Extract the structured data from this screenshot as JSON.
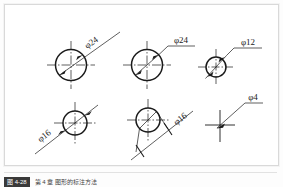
{
  "figure": {
    "frame_color": "#d9d9d9",
    "line_color": "#1a1a1a",
    "background": "#ffffff"
  },
  "caption": {
    "tag": "图 4-28",
    "text": "第 4 章 图形的标注方法"
  },
  "items": [
    {
      "id": "circle-phi24-oblique",
      "label": "φ24",
      "value": 24,
      "diameter_px": 31,
      "center": {
        "x": 66,
        "y": 60
      },
      "leader_style": "oblique-through-circle",
      "text_rotated": true,
      "text_angle": -35,
      "arrows": "both-ends-inside",
      "centerlines": "dash-dot-cross"
    },
    {
      "id": "circle-phi24-horizontal-shelf",
      "label": "φ24",
      "value": 24,
      "diameter_px": 31,
      "center": {
        "x": 142,
        "y": 60
      },
      "leader_style": "diagonal-with-horizontal-shelf",
      "text_rotated": false,
      "text_angle": 0,
      "arrows": "both-ends-inside",
      "centerlines": "dash-dot-cross"
    },
    {
      "id": "circle-phi12",
      "label": "φ12",
      "value": 12,
      "diameter_px": 20,
      "center": {
        "x": 211,
        "y": 62
      },
      "leader_style": "diagonal-with-horizontal-shelf",
      "text_rotated": false,
      "text_angle": 0,
      "arrows": "both-ends-outside",
      "centerlines": "dash-dot-cross"
    },
    {
      "id": "circle-phi16-oblique",
      "label": "φ16",
      "value": 16,
      "diameter_px": 24,
      "center": {
        "x": 70,
        "y": 118
      },
      "leader_style": "oblique-through-circle-extended",
      "text_rotated": true,
      "text_angle": -38,
      "arrows": "both-ends-outside",
      "centerlines": "dash-dot-cross"
    },
    {
      "id": "circle-phi16-external-ticks",
      "label": "φ16",
      "value": 16,
      "diameter_px": 24,
      "center": {
        "x": 143,
        "y": 115
      },
      "leader_style": "external-dimension-line-oblique-ticks",
      "text_rotated": true,
      "text_angle": -38,
      "arrows": "oblique-slash-ticks",
      "centerlines": "dash-dot-cross"
    },
    {
      "id": "center-mark-phi4",
      "label": "φ4",
      "value": 4,
      "diameter_px": 0,
      "center": {
        "x": 215,
        "y": 120
      },
      "leader_style": "diagonal-with-horizontal-shelf",
      "text_rotated": false,
      "text_angle": 0,
      "arrows": "single-arrow-to-center",
      "centerlines": "cross-only-no-circle"
    }
  ]
}
